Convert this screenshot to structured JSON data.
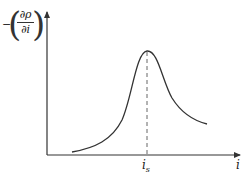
{
  "diagram": {
    "y_axis_label": {
      "sign": "−",
      "numerator": "∂ρ",
      "denominator": "∂i",
      "left_paren": "(",
      "right_paren": ")"
    },
    "x_axis_label": "i",
    "peak_label": {
      "base": "i",
      "subscript": "s"
    },
    "colors": {
      "axis": "#333333",
      "curve": "#333333",
      "dashed": "#666666"
    }
  }
}
